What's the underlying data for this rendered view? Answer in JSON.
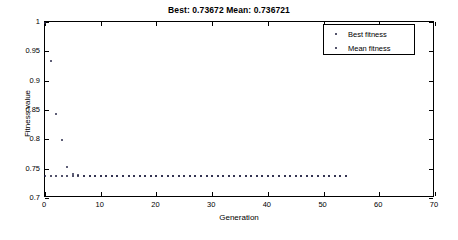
{
  "chart_data": {
    "type": "scatter",
    "title": "Best: 0.73672 Mean: 0.736721",
    "xlabel": "Generation",
    "ylabel": "Fitness value",
    "xlim": [
      0,
      70
    ],
    "ylim": [
      0.7,
      1
    ],
    "xticks": [
      0,
      10,
      20,
      30,
      40,
      50,
      60,
      70
    ],
    "yticks": [
      0.7,
      0.75,
      0.8,
      0.85,
      0.9,
      0.95,
      1
    ],
    "xtick_labels": [
      "0",
      "10",
      "20",
      "30",
      "40",
      "50",
      "60",
      "70"
    ],
    "ytick_labels": [
      "0.7",
      "0.75",
      "0.8",
      "0.85",
      "0.9",
      "0.95",
      "1"
    ],
    "grid": false,
    "legend_position": "upper right",
    "marker_color": "#1a1a3a",
    "axis_color": "#000000",
    "background": "#ffffff",
    "series": [
      {
        "name": "Best fitness",
        "marker": "dot",
        "x": [
          0,
          1,
          2,
          3,
          4,
          5,
          6,
          7,
          8,
          9,
          10,
          11,
          12,
          13,
          14,
          15,
          16,
          17,
          18,
          19,
          20,
          21,
          22,
          23,
          24,
          25,
          26,
          27,
          28,
          29,
          30,
          31,
          32,
          33,
          34,
          35,
          36,
          37,
          38,
          39,
          40,
          41,
          42,
          43,
          44,
          45,
          46,
          47,
          48,
          49,
          50,
          51,
          52,
          53,
          54
        ],
        "values": [
          0.7382,
          0.7378,
          0.7375,
          0.7373,
          0.7372,
          0.73705,
          0.73695,
          0.7369,
          0.73685,
          0.73682,
          0.7368,
          0.73678,
          0.73677,
          0.73676,
          0.73675,
          0.73675,
          0.73674,
          0.73674,
          0.73673,
          0.73673,
          0.73673,
          0.73672,
          0.73672,
          0.73672,
          0.73672,
          0.73672,
          0.73672,
          0.73672,
          0.73672,
          0.73672,
          0.73672,
          0.73672,
          0.73672,
          0.73672,
          0.73672,
          0.73672,
          0.73672,
          0.73672,
          0.73672,
          0.73672,
          0.73672,
          0.73672,
          0.73672,
          0.73672,
          0.73672,
          0.73672,
          0.73672,
          0.73672,
          0.73672,
          0.73672,
          0.73672,
          0.73672,
          0.73672,
          0.73672,
          0.73672
        ]
      },
      {
        "name": "Mean fitness",
        "marker": "dot",
        "x": [
          0,
          1,
          2,
          3,
          4,
          5,
          6,
          7,
          8,
          9,
          10,
          11,
          12,
          13,
          14,
          15,
          16,
          17,
          18,
          19,
          20,
          21,
          22,
          23,
          24,
          25,
          26,
          27,
          28,
          29,
          30,
          31,
          32,
          33,
          34,
          35,
          36,
          37,
          38,
          39,
          40,
          41,
          42,
          43,
          44,
          45,
          46,
          47,
          48,
          49,
          50,
          51,
          52,
          53,
          54
        ],
        "values": [
          0.999,
          0.933,
          0.843,
          0.7985,
          0.752,
          0.741,
          0.7385,
          0.738,
          0.7378,
          0.7377,
          0.7376,
          0.7375,
          0.73745,
          0.7374,
          0.73735,
          0.7373,
          0.73728,
          0.73726,
          0.73724,
          0.73722,
          0.7372,
          0.73718,
          0.73716,
          0.73714,
          0.73712,
          0.7371,
          0.73708,
          0.73706,
          0.73705,
          0.73704,
          0.73703,
          0.73702,
          0.73701,
          0.737,
          0.73699,
          0.73698,
          0.73697,
          0.73696,
          0.73695,
          0.73694,
          0.73693,
          0.73692,
          0.73691,
          0.7369,
          0.73689,
          0.73688,
          0.73687,
          0.73686,
          0.73685,
          0.73684,
          0.73683,
          0.73682,
          0.73681,
          0.7368,
          0.73679
        ]
      }
    ]
  },
  "legend": {
    "entries": [
      "Best fitness",
      "Mean fitness"
    ]
  }
}
